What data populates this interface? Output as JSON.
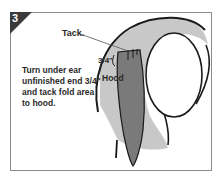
{
  "step": {
    "number": "3"
  },
  "labels": {
    "tack": "Tack.",
    "measurement": "3/4\"",
    "hood": "Hood"
  },
  "instruction": {
    "text": "Turn under ear unfinished end 3/4\" and tack fold area to hood."
  },
  "colors": {
    "badge": "#3a3a3a",
    "frame_border": "#8a8a8a",
    "hood_fill": "#c8c8c8",
    "ear_fill": "#7a7a7a",
    "outline": "#1a1a1a"
  }
}
